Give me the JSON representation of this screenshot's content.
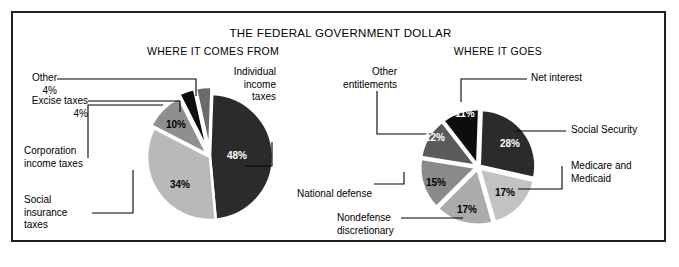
{
  "title": "THE FEDERAL GOVERNMENT DOLLAR",
  "panels": {
    "left": {
      "heading": "WHERE IT COMES FROM"
    },
    "right": {
      "heading": "WHERE IT GOES"
    }
  },
  "chart_data": [
    {
      "type": "pie",
      "title": "WHERE IT COMES FROM",
      "legend_position": "callout-labels",
      "labels": [
        "Individual income taxes",
        "Social insurance taxes",
        "Corporation income taxes",
        "Excise taxes",
        "Other"
      ],
      "values": [
        48,
        34,
        10,
        4,
        4
      ],
      "value_labels": [
        "48%",
        "34%",
        "10%",
        "4%",
        "4%"
      ],
      "colors": [
        "#2b2b2b",
        "#b9b9b9",
        "#8f8f8f",
        "#0d0d0d",
        "#6b6b6b"
      ],
      "units": "percent"
    },
    {
      "type": "pie",
      "title": "WHERE IT GOES",
      "legend_position": "callout-labels",
      "labels": [
        "Social Security",
        "Medicare and Medicaid",
        "Nondefense discretionary",
        "National defense",
        "Other entitlements",
        "Net interest"
      ],
      "values": [
        28,
        17,
        17,
        15,
        12,
        11
      ],
      "value_labels": [
        "28%",
        "17%",
        "17%",
        "15%",
        "12%",
        "11%"
      ],
      "colors": [
        "#2b2b2b",
        "#c2c2c2",
        "#ababab",
        "#8a8a8a",
        "#5a5a5a",
        "#0d0d0d"
      ],
      "units": "percent"
    }
  ],
  "left_chart": {
    "callouts": [
      {
        "key": "other",
        "text": "Other\n4%"
      },
      {
        "key": "excise",
        "text": "Excise taxes\n4%"
      },
      {
        "key": "corporation",
        "text": "Corporation\nincome taxes"
      },
      {
        "key": "social_insurance",
        "text": "Social\ninsurance\ntaxes"
      },
      {
        "key": "individual",
        "text": "Individual\nincome\ntaxes"
      }
    ],
    "slice_values": [
      "48%",
      "34%",
      "10%"
    ]
  },
  "right_chart": {
    "callouts": [
      {
        "key": "other_entitlements",
        "text": "Other\nentitlements"
      },
      {
        "key": "net_interest",
        "text": "Net interest"
      },
      {
        "key": "social_security",
        "text": "Social Security"
      },
      {
        "key": "medicare",
        "text": "Medicare and\nMedicaid"
      },
      {
        "key": "national_defense",
        "text": "National defense"
      },
      {
        "key": "nondefense",
        "text": "Nondefense\ndiscretionary"
      }
    ],
    "slice_values": [
      "11%",
      "28%",
      "17%",
      "17%",
      "15%",
      "12%"
    ]
  },
  "colors": {
    "frame": "#231f20",
    "background": "#ffffff",
    "leader_line": "#000000"
  }
}
